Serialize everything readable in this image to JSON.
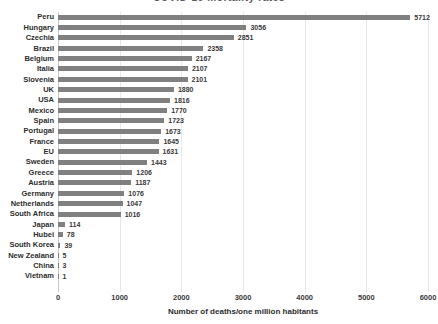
{
  "chart_data": {
    "type": "bar",
    "orientation": "horizontal",
    "title": "COVID-19 mortality rates",
    "xlabel": "Number of deaths/one million habitants",
    "ylabel": "",
    "xlim": [
      0,
      6000
    ],
    "xticks": [
      0,
      1000,
      2000,
      3000,
      4000,
      5000,
      6000
    ],
    "xtick_labels": [
      "0",
      "1000",
      "2000",
      "3000",
      "4000",
      "5000",
      "6000"
    ],
    "grid": true,
    "grid_axis": "x",
    "legend": false,
    "bar_color": "#808080",
    "data_labels": true,
    "categories": [
      "Peru",
      "Hungary",
      "Czechia",
      "Brazil",
      "Belgium",
      "Italia",
      "Slovenia",
      "UK",
      "USA",
      "Mexico",
      "Spain",
      "Portugal",
      "France",
      "EU",
      "Sweden",
      "Greece",
      "Austria",
      "Germany",
      "Netherlands",
      "South Africa",
      "Japan",
      "Hubei",
      "South Korea",
      "New Zealand",
      "China",
      "Vietnam"
    ],
    "values": [
      5712,
      3056,
      2851,
      2358,
      2167,
      2107,
      2101,
      1880,
      1816,
      1770,
      1723,
      1673,
      1645,
      1631,
      1443,
      1206,
      1187,
      1076,
      1047,
      1016,
      114,
      78,
      39,
      5,
      3,
      1
    ],
    "value_labels": [
      "5712",
      "3056",
      "2851",
      "2358",
      "2167",
      "2107",
      "2101",
      "1880",
      "1816",
      "1770",
      "1723",
      "1673",
      "1645",
      "1631",
      "1443",
      "1206",
      "1187",
      "1076",
      "1047",
      "1016",
      "114",
      "78",
      "39",
      "5",
      "3",
      "1"
    ]
  }
}
